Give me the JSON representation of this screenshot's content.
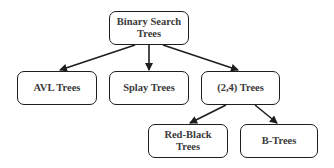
{
  "diagram": {
    "type": "hierarchy",
    "nodes": [
      {
        "id": "bst",
        "label": "Binary Search\nTrees",
        "x": 109,
        "y": 11,
        "w": 80,
        "h": 34
      },
      {
        "id": "avl",
        "label": "AVL Trees",
        "x": 17,
        "y": 71,
        "w": 80,
        "h": 34
      },
      {
        "id": "splay",
        "label": "Splay Trees",
        "x": 109,
        "y": 71,
        "w": 80,
        "h": 34
      },
      {
        "id": "two-four",
        "label": "(2,4) Trees",
        "x": 201,
        "y": 71,
        "w": 79,
        "h": 34
      },
      {
        "id": "red-black",
        "label": "Red-Black Trees",
        "x": 148,
        "y": 124,
        "w": 80,
        "h": 34
      },
      {
        "id": "b-trees",
        "label": "B-Trees",
        "x": 240,
        "y": 124,
        "w": 78,
        "h": 34
      }
    ],
    "edges": [
      {
        "from": "bst",
        "to": "avl",
        "x1": 135,
        "y1": 45,
        "x2": 60,
        "y2": 70
      },
      {
        "from": "bst",
        "to": "splay",
        "x1": 149,
        "y1": 45,
        "x2": 149,
        "y2": 70
      },
      {
        "from": "bst",
        "to": "two-four",
        "x1": 163,
        "y1": 45,
        "x2": 238,
        "y2": 70
      },
      {
        "from": "two-four",
        "to": "red-black",
        "x1": 226,
        "y1": 105,
        "x2": 190,
        "y2": 123
      },
      {
        "from": "two-four",
        "to": "b-trees",
        "x1": 255,
        "y1": 105,
        "x2": 277,
        "y2": 123
      }
    ],
    "colors": {
      "stroke": "#1e1e1e",
      "text": "#3a3a3a",
      "background": "#ffffff"
    }
  }
}
